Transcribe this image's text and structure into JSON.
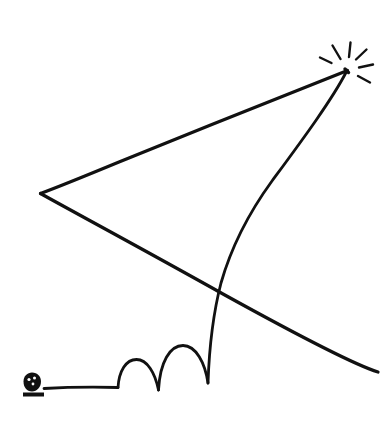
{
  "illustration": {
    "title": "Kite with bouncing tail and spark",
    "style": "hand-drawn black ink line drawing",
    "background_color": "#ffffff",
    "ink_color": "#111111",
    "canvas": {
      "width": 384,
      "height": 433
    },
    "elements": [
      {
        "name": "kite-upper-edge",
        "label": "Kite upper edge",
        "type": "polyline",
        "points": "347,70 40,193",
        "stroke_width": 3.0
      },
      {
        "name": "kite-lower-edge",
        "label": "Kite lower edge (extends to lower right)",
        "type": "polyline",
        "points": "40,193 378,372",
        "stroke_width": 3.0
      },
      {
        "name": "kite-spine-curve",
        "label": "Curved kite spine from apex down to ground",
        "type": "curve",
        "path": "M347,70 C322,120 272,186 236,258 C222,292 212,340 208,383",
        "stroke_width": 2.6
      },
      {
        "name": "spark-burst",
        "label": "Spark burst at kite apex",
        "type": "rays",
        "center": "347,70",
        "ray_count": 7
      },
      {
        "name": "ground-line",
        "label": "Flat ground line from anchor rock",
        "type": "polyline",
        "points": "44,388 118,387",
        "stroke_width": 2.6
      },
      {
        "name": "bounce-arc-1",
        "label": "First small bounce arc",
        "type": "arc",
        "path": "M118,387 C122,364 133,358 142,362 C152,367 156,378 159,390",
        "stroke_width": 2.6
      },
      {
        "name": "bounce-arc-2",
        "label": "Second larger bounce arc",
        "type": "arc",
        "path": "M159,390 C161,358 172,344 184,344 C197,345 205,364 208,383",
        "stroke_width": 2.6
      },
      {
        "name": "anchor-rock",
        "label": "Small rock anchoring the string",
        "type": "blob",
        "center": "31,385",
        "radius": 9
      },
      {
        "name": "anchor-base",
        "label": "Shadow base beneath the rock",
        "type": "bar",
        "center": "33,396"
      }
    ],
    "spark_rays": [
      {
        "name": "ray-1",
        "from": "340,58",
        "to": "333,46"
      },
      {
        "name": "ray-2",
        "from": "349,57",
        "to": "350,43"
      },
      {
        "name": "ray-3",
        "from": "356,60",
        "to": "366,50"
      },
      {
        "name": "ray-4",
        "from": "359,68",
        "to": "372,65"
      },
      {
        "name": "ray-5",
        "from": "358,76",
        "to": "369,82"
      },
      {
        "name": "ray-6",
        "from": "331,63",
        "to": "320,58"
      },
      {
        "name": "ray-7",
        "from": "352,79",
        "to": "356,90"
      }
    ]
  }
}
